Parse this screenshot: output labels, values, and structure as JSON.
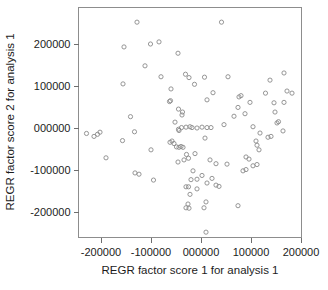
{
  "chart_data": {
    "type": "scatter",
    "title": "",
    "subtitle": "",
    "xlabel": "REGR factor score 1 for analysis 1",
    "ylabel": "REGR factor score 2 for analysis 1",
    "xlim": [
      -250000,
      215000
    ],
    "ylim": [
      -265000,
      270000
    ],
    "grid": false,
    "legend": null,
    "xticks": [
      -200000,
      -100000,
      0,
      100000,
      200000
    ],
    "xticklabels": [
      "-200000",
      "-100000",
      "000000",
      "100000",
      "200000"
    ],
    "yticks": [
      200000,
      100000,
      0,
      -100000,
      -200000
    ],
    "yticklabels": [
      "200000",
      "100000",
      "000000",
      "-100000",
      "-200000"
    ],
    "marker": "open-circle",
    "marker_color": "#8a8a8a",
    "n_points": 112,
    "series": [
      {
        "name": "REGR factor scores",
        "points": [
          [
            -128000,
            252000
          ],
          [
            41000,
            252000
          ],
          [
            -154000,
            193000
          ],
          [
            -101000,
            200000
          ],
          [
            -84000,
            205000
          ],
          [
            -156000,
            105000
          ],
          [
            -112000,
            148000
          ],
          [
            -80000,
            122000
          ],
          [
            -46000,
            178000
          ],
          [
            -60000,
            93000
          ],
          [
            -31000,
            128000
          ],
          [
            -24000,
            120000
          ],
          [
            -13000,
            104000
          ],
          [
            7000,
            121000
          ],
          [
            54000,
            122000
          ],
          [
            138000,
            114000
          ],
          [
            166000,
            131000
          ],
          [
            -63000,
            63000
          ],
          [
            -61000,
            65000
          ],
          [
            -38000,
            31000
          ],
          [
            -45000,
            45000
          ],
          [
            -37000,
            38000
          ],
          [
            24000,
            84000
          ],
          [
            12000,
            67000
          ],
          [
            76000,
            74000
          ],
          [
            80000,
            77000
          ],
          [
            98000,
            61000
          ],
          [
            129000,
            83000
          ],
          [
            146000,
            60000
          ],
          [
            172000,
            88000
          ],
          [
            182000,
            83000
          ],
          [
            166000,
            61000
          ],
          [
            -141000,
            27000
          ],
          [
            -133000,
            -9000
          ],
          [
            -157000,
            -30000
          ],
          [
            -229000,
            -13000
          ],
          [
            -214000,
            -20000
          ],
          [
            -207000,
            -15000
          ],
          [
            -202000,
            -10000
          ],
          [
            -190000,
            -71000
          ],
          [
            -52000,
            14000
          ],
          [
            -45000,
            -3000
          ],
          [
            -44000,
            -6000
          ],
          [
            -39000,
            1000
          ],
          [
            -30000,
            2000
          ],
          [
            -22000,
            3000
          ],
          [
            -18000,
            1000
          ],
          [
            -8000,
            0
          ],
          [
            2000,
            2000
          ],
          [
            12000,
            1000
          ],
          [
            20000,
            1000
          ],
          [
            46000,
            8000
          ],
          [
            66000,
            28000
          ],
          [
            74000,
            49000
          ],
          [
            88000,
            34000
          ],
          [
            104000,
            3000
          ],
          [
            118000,
            -12000
          ],
          [
            134000,
            -22000
          ],
          [
            140000,
            -20000
          ],
          [
            152000,
            12000
          ],
          [
            155000,
            15000
          ],
          [
            148000,
            38000
          ],
          [
            164000,
            -7000
          ],
          [
            -62000,
            -34000
          ],
          [
            -58000,
            -31000
          ],
          [
            -54000,
            -37000
          ],
          [
            -49000,
            -45000
          ],
          [
            -44000,
            -46000
          ],
          [
            -40000,
            -44000
          ],
          [
            -36000,
            -46000
          ],
          [
            -29000,
            -63000
          ],
          [
            -25000,
            -72000
          ],
          [
            -34000,
            -76000
          ],
          [
            -46000,
            -81000
          ],
          [
            -100000,
            -52000
          ],
          [
            -132000,
            -107000
          ],
          [
            -124000,
            -110000
          ],
          [
            -95000,
            -124000
          ],
          [
            -12000,
            -61000
          ],
          [
            8000,
            -24000
          ],
          [
            18000,
            -76000
          ],
          [
            30000,
            -85000
          ],
          [
            52000,
            -86000
          ],
          [
            110000,
            -31000
          ],
          [
            112000,
            -41000
          ],
          [
            116000,
            -52000
          ],
          [
            90000,
            -69000
          ],
          [
            96000,
            -74000
          ],
          [
            104000,
            -90000
          ],
          [
            112000,
            -87000
          ],
          [
            84000,
            -102000
          ],
          [
            90000,
            -99000
          ],
          [
            -16000,
            -102000
          ],
          [
            -8000,
            -122000
          ],
          [
            -20000,
            -123000
          ],
          [
            -25000,
            -140000
          ],
          [
            2000,
            -113000
          ],
          [
            12000,
            -131000
          ],
          [
            22000,
            -120000
          ],
          [
            30000,
            -136000
          ],
          [
            36000,
            -139000
          ],
          [
            -8000,
            -145000
          ],
          [
            -22000,
            -158000
          ],
          [
            -30000,
            -140000
          ],
          [
            -26000,
            -181000
          ],
          [
            -30000,
            -190000
          ],
          [
            -24000,
            -191000
          ],
          [
            10000,
            -176000
          ],
          [
            6000,
            -190000
          ],
          [
            74000,
            -185000
          ],
          [
            10000,
            -248000
          ]
        ]
      }
    ]
  }
}
